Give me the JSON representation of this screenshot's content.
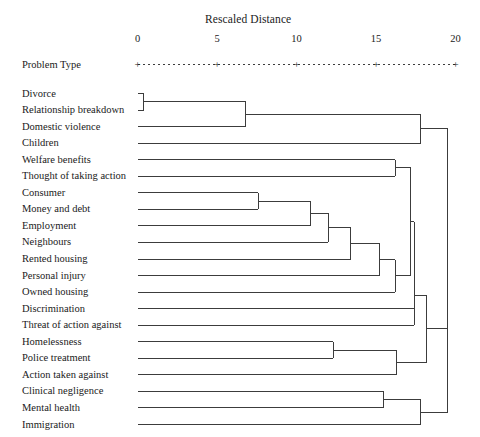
{
  "figure": {
    "type": "dendrogram",
    "axis_title": "Rescaled Distance",
    "row_header": "Problem Type",
    "line_color": "#3c3c3c",
    "text_color": "#1a1a1a",
    "background": "#ffffff"
  },
  "axis": {
    "ticks": [
      {
        "value": 0,
        "label": "0"
      },
      {
        "value": 5,
        "label": "5"
      },
      {
        "value": 10,
        "label": "10"
      },
      {
        "value": 15,
        "label": "15"
      },
      {
        "value": 20,
        "label": "20"
      }
    ],
    "min": 0,
    "max": 20,
    "marker_glyph": "+"
  },
  "chart_data": {
    "type": "dendrogram",
    "title": "Rescaled Distance",
    "xlabel": "Rescaled Distance",
    "ylabel": "Problem Type",
    "xlim": [
      0,
      20
    ],
    "grid": false,
    "legend": null,
    "leaves": [
      "Divorce",
      "Relationship breakdown",
      "Domestic violence",
      "Children",
      "Welfare benefits",
      "Thought of taking action",
      "Consumer",
      "Money and debt",
      "Employment",
      "Neighbours",
      "Rented housing",
      "Personal injury",
      "Owned housing",
      "Discrimination",
      "Threat of action against",
      "Homelessness",
      "Police treatment",
      "Action taken against",
      "Clinical negligence",
      "Mental health",
      "Immigration"
    ],
    "merges": [
      {
        "id": "m1",
        "left": "Divorce",
        "right": "Relationship breakdown",
        "distance": 0.4
      },
      {
        "id": "m2",
        "left": "m1",
        "right": "Domestic violence",
        "distance": 6.8
      },
      {
        "id": "m3",
        "left": "Consumer",
        "right": "Money and debt",
        "distance": 7.6
      },
      {
        "id": "m4",
        "left": "m3",
        "right": "Employment",
        "distance": 10.9
      },
      {
        "id": "m5",
        "left": "m4",
        "right": "Neighbours",
        "distance": 12.0
      },
      {
        "id": "m6",
        "left": "m5",
        "right": "Rented housing",
        "distance": 13.4
      },
      {
        "id": "m7",
        "left": "Homelessness",
        "right": "Police treatment",
        "distance": 12.3
      },
      {
        "id": "m8",
        "left": "m6",
        "right": "Personal injury",
        "distance": 15.2
      },
      {
        "id": "m9",
        "left": "Clinical negligence",
        "right": "Mental health",
        "distance": 15.5
      },
      {
        "id": "m10",
        "left": "m8",
        "right": "Owned housing",
        "distance": 16.2
      },
      {
        "id": "m11",
        "left": "m7",
        "right": "Action taken against",
        "distance": 16.3
      },
      {
        "id": "m12",
        "left": "m2",
        "right": "Children",
        "distance": 17.8
      },
      {
        "id": "m13",
        "left": "Welfare benefits",
        "right": "Thought of taking action",
        "distance": 16.2
      },
      {
        "id": "m14",
        "left": "m13",
        "right": "m10",
        "distance": 17.2
      },
      {
        "id": "m15",
        "left": "m14",
        "right": "Discrimination",
        "distance": 17.4
      },
      {
        "id": "m16",
        "left": "m15",
        "right": "Threat of action against",
        "distance": 17.4
      },
      {
        "id": "m17",
        "left": "m16",
        "right": "m11",
        "distance": 18.2
      },
      {
        "id": "m18",
        "left": "m9",
        "right": "Immigration",
        "distance": 17.8
      },
      {
        "id": "m19",
        "left": "m12",
        "right": "m17",
        "distance": 19.5
      },
      {
        "id": "m20",
        "left": "m19",
        "right": "m18",
        "distance": 19.5
      }
    ]
  }
}
